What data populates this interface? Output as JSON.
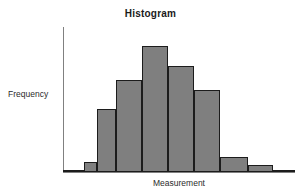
{
  "chart_data": {
    "type": "bar",
    "title": "Histogram",
    "xlabel": "Measurement",
    "ylabel": "Frequency",
    "categories": [
      "1",
      "2",
      "3",
      "4",
      "5",
      "6",
      "7",
      "8",
      "9",
      "10"
    ],
    "values": [
      1,
      4,
      26,
      38,
      52,
      44,
      34,
      6,
      3,
      1
    ],
    "ylim": [
      0,
      60
    ],
    "grid": false,
    "legend": false,
    "bar_fill_color": "#7f7f7f",
    "bar_edge_color": "#1c1c1c",
    "axis_color": "#808080",
    "background_color": "#ffffff",
    "bin_left_edges_px": [
      0,
      21,
      34,
      53,
      79,
      105,
      131,
      157,
      185,
      210
    ],
    "bin_right_edges_px": [
      21,
      34,
      53,
      79,
      105,
      131,
      157,
      185,
      210,
      232
    ]
  },
  "figure": {
    "title": "Histogram",
    "x_axis_label": "Measurement",
    "y_axis_label": "Frequency"
  }
}
